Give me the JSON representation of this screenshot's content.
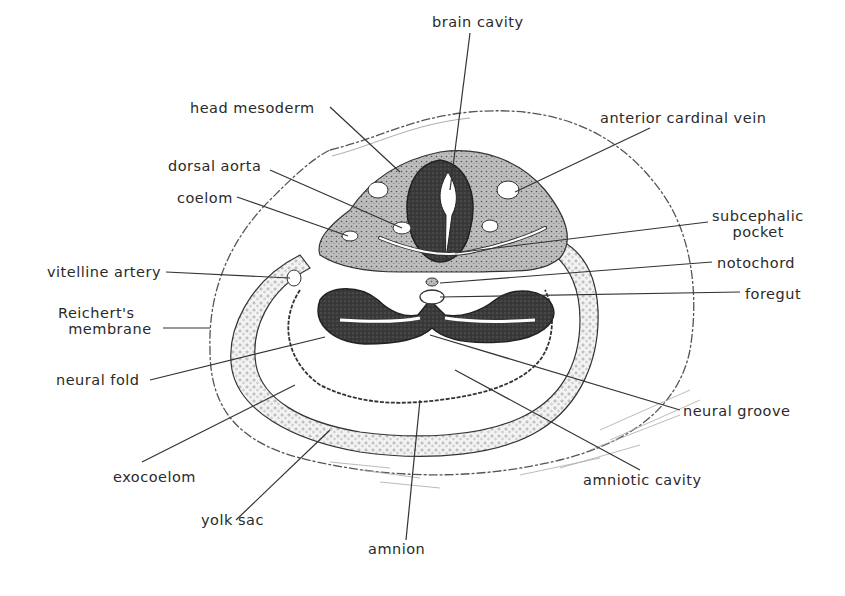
{
  "diagram": {
    "labels": [
      {
        "id": "brain-cavity",
        "text": "brain cavity",
        "x": 432,
        "y": 14
      },
      {
        "id": "head-mesoderm",
        "text": "head mesoderm",
        "x": 190,
        "y": 100
      },
      {
        "id": "anterior-cardinal-vein",
        "text": "anterior cardinal vein",
        "x": 600,
        "y": 110
      },
      {
        "id": "dorsal-aorta",
        "text": "dorsal aorta",
        "x": 168,
        "y": 158
      },
      {
        "id": "coelom",
        "text": "coelom",
        "x": 177,
        "y": 190
      },
      {
        "id": "subcephalic-pocket",
        "text": "subcephalic\n    pocket",
        "x": 712,
        "y": 208
      },
      {
        "id": "vitelline-artery",
        "text": "vitelline artery",
        "x": 47,
        "y": 264
      },
      {
        "id": "notochord",
        "text": "notochord",
        "x": 717,
        "y": 255
      },
      {
        "id": "foregut",
        "text": "foregut",
        "x": 745,
        "y": 286
      },
      {
        "id": "reicherts-membrane",
        "text": "Reichert's\n  membrane",
        "x": 58,
        "y": 305
      },
      {
        "id": "neural-fold",
        "text": "neural fold",
        "x": 56,
        "y": 372
      },
      {
        "id": "neural-groove",
        "text": "neural groove",
        "x": 683,
        "y": 403
      },
      {
        "id": "exocoelom",
        "text": "exocoelom",
        "x": 113,
        "y": 469
      },
      {
        "id": "amniotic-cavity",
        "text": "amniotic cavity",
        "x": 583,
        "y": 472
      },
      {
        "id": "yolk-sac",
        "text": "yolk sac",
        "x": 201,
        "y": 512
      },
      {
        "id": "amnion",
        "text": "amnion",
        "x": 368,
        "y": 541
      }
    ]
  },
  "colors": {
    "ink": "#2a2a2a",
    "dark_tissue": "#3a3a3a",
    "stipple": "#9a9a9a",
    "background": "#ffffff"
  }
}
